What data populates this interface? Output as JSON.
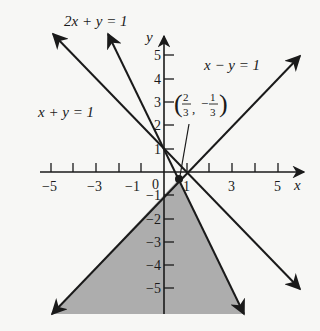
{
  "figure": {
    "type": "system-of-inequalities-graph",
    "axes": {
      "x_label": "x",
      "y_label": "y",
      "x_ticks": [
        -5,
        -4,
        -3,
        -2,
        -1,
        1,
        2,
        3,
        4,
        5
      ],
      "x_tick_labels": [
        {
          "value": -5,
          "text": "−5"
        },
        {
          "value": -3,
          "text": "−3"
        },
        {
          "value": -1,
          "text": "−1"
        },
        {
          "value": 0,
          "text": "0"
        },
        {
          "value": 1,
          "text": "1"
        },
        {
          "value": 3,
          "text": "3"
        },
        {
          "value": 5,
          "text": "5"
        }
      ],
      "y_tick_labels": [
        {
          "value": 5,
          "text": "5"
        },
        {
          "value": 4,
          "text": "4"
        },
        {
          "value": 3,
          "text": "3"
        },
        {
          "value": 2,
          "text": "2"
        },
        {
          "value": 1,
          "text": "1"
        },
        {
          "value": -1,
          "text": "−1"
        },
        {
          "value": -2,
          "text": "−2"
        },
        {
          "value": -3,
          "text": "−3"
        },
        {
          "value": -4,
          "text": "−4"
        },
        {
          "value": -5,
          "text": "−5"
        }
      ]
    },
    "lines": [
      {
        "equation": "2x + y = 1",
        "label": "2x + y = 1"
      },
      {
        "equation": "x + y = 1",
        "label": "x + y = 1"
      },
      {
        "equation": "x − y = 1",
        "label": "x − y = 1"
      }
    ],
    "point": {
      "x": "2/3",
      "y": "-1/3",
      "label_open": "(",
      "x_num": "2",
      "x_den": "3",
      "sep": ",",
      "y_sign": "−",
      "y_num": "1",
      "y_den": "3",
      "label_close": ")"
    },
    "shaded_region": {
      "description": "Region below vertex bounded by 2x + y = 1 and x − y = 1",
      "color": "#a9a9a9"
    },
    "colors": {
      "ink": "#1a1a1a",
      "background": "#f7f7f5",
      "shade": "#a9a9a9"
    }
  }
}
